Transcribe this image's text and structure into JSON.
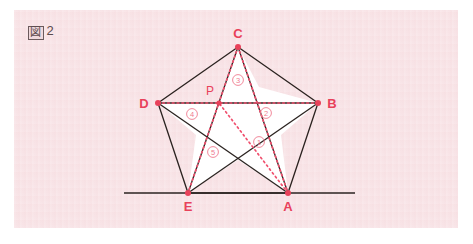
{
  "figure": {
    "caption_kanji": "図",
    "caption_number": "2",
    "caption_full": "図2"
  },
  "colors": {
    "paper_background": "#f8e3e6",
    "page_background": "#ffffff",
    "solid_line": "#2b2320",
    "dotted_line": "#f0506e",
    "vertex_dot": "#e8415a",
    "label_text": "#e8415a",
    "number_text": "#ef7c90",
    "star_fill": "#ffffff",
    "caption_text": "#5b4a4c"
  },
  "geometry": {
    "vertices": [
      {
        "id": "A",
        "label": "A",
        "x": 288,
        "y": 193,
        "label_x": 288,
        "label_y": 211
      },
      {
        "id": "B",
        "label": "B",
        "x": 318,
        "y": 103,
        "label_x": 332,
        "label_y": 108
      },
      {
        "id": "C",
        "label": "C",
        "x": 238,
        "y": 47,
        "label_x": 238,
        "label_y": 38
      },
      {
        "id": "D",
        "label": "D",
        "x": 158,
        "y": 103,
        "label_x": 144,
        "label_y": 108
      },
      {
        "id": "E",
        "label": "E",
        "x": 188,
        "y": 193,
        "label_x": 188,
        "label_y": 211
      },
      {
        "id": "P",
        "label": "P",
        "x": 219,
        "y": 103,
        "label_x": 210,
        "label_y": 95
      }
    ],
    "inner_star_points": [
      {
        "id": "I_AB",
        "x": 281,
        "y": 135
      },
      {
        "id": "I_BC",
        "x": 259,
        "y": 87
      },
      {
        "id": "I_CD",
        "x": 219,
        "y": 103
      },
      {
        "id": "I_DE",
        "x": 196,
        "y": 135
      },
      {
        "id": "I_EA",
        "x": 238,
        "y": 160
      }
    ],
    "baseline": {
      "x1": 124,
      "y1": 193,
      "x2": 355,
      "y2": 193
    },
    "dotted_segments": [
      {
        "from": "D",
        "to": "B",
        "label": "diagonal-db"
      },
      {
        "from": "C",
        "to": "E",
        "label": "diagonal-ce"
      },
      {
        "from": "C",
        "to": "A",
        "label": "diagonal-ca"
      },
      {
        "from": "A",
        "to": "P",
        "label": "segment-ap"
      }
    ]
  },
  "region_numbers": [
    {
      "id": "1",
      "label": "①",
      "x": 259,
      "y": 142
    },
    {
      "id": "2",
      "label": "②",
      "x": 266,
      "y": 113
    },
    {
      "id": "3",
      "label": "③",
      "x": 238,
      "y": 80
    },
    {
      "id": "4",
      "label": "④",
      "x": 192,
      "y": 114
    },
    {
      "id": "5",
      "label": "⑤",
      "x": 213,
      "y": 152
    }
  ]
}
